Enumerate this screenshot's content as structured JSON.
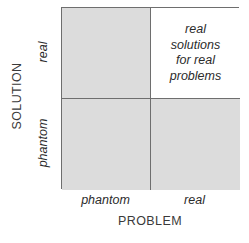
{
  "chart_data": {
    "type": "table",
    "title": "",
    "xlabel": "PROBLEM",
    "ylabel": "SOLUTION",
    "x_categories": [
      "phantom",
      "real"
    ],
    "y_categories": [
      "phantom",
      "real"
    ],
    "grid": true,
    "legend": "none",
    "cells": [
      {
        "row": "real",
        "col": "phantom",
        "text": "",
        "fill": "#dcdcdc"
      },
      {
        "row": "real",
        "col": "real",
        "text": "real\nsolutions\nfor real\nproblems",
        "fill": "#ffffff"
      },
      {
        "row": "phantom",
        "col": "phantom",
        "text": "",
        "fill": "#dcdcdc"
      },
      {
        "row": "phantom",
        "col": "real",
        "text": "",
        "fill": "#dcdcdc"
      }
    ]
  },
  "axes": {
    "y": {
      "title": "SOLUTION",
      "ticks": {
        "top": "real",
        "bottom": "phantom"
      }
    },
    "x": {
      "title": "PROBLEM",
      "ticks": {
        "left": "phantom",
        "right": "real"
      }
    }
  },
  "quadrants": {
    "top_left": "",
    "top_right": "real\nsolutions\nfor real\nproblems",
    "bottom_left": "",
    "bottom_right": ""
  },
  "colors": {
    "gray_fill": "#dcdcdc",
    "white_fill": "#ffffff",
    "line": "#6e6e6e",
    "text": "#2b2b2b",
    "axis_text": "#3a3a3a"
  }
}
